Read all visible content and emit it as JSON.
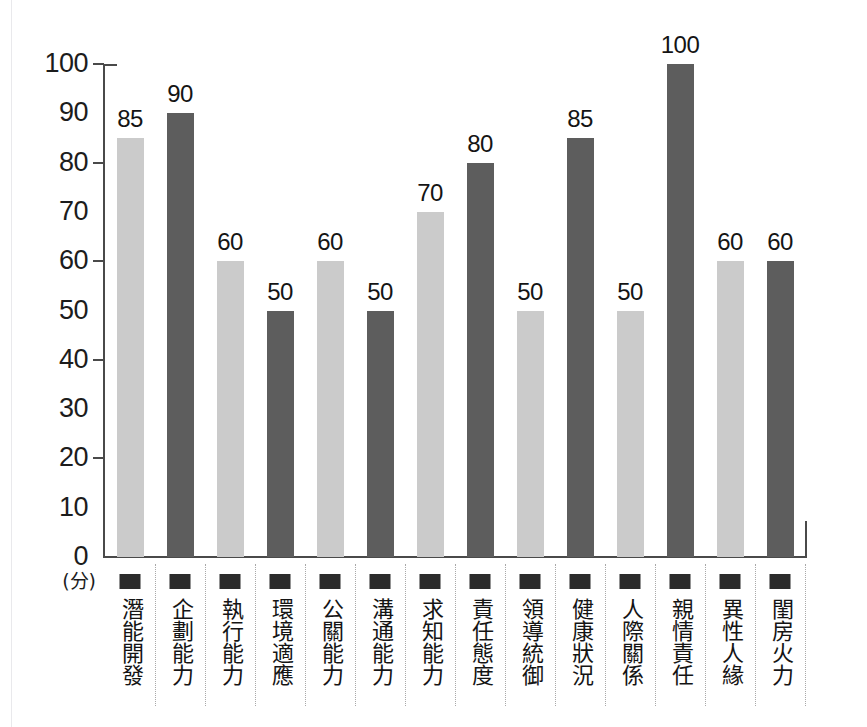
{
  "chart_data": {
    "type": "bar",
    "title": "",
    "subtitle": "",
    "xlabel": "",
    "ylabel": "(分)",
    "ylim": [
      0,
      100
    ],
    "ytick_step": 10,
    "ytick_labels": [
      "100",
      "90",
      "80",
      "70",
      "60",
      "50",
      "40",
      "30",
      "20",
      "10",
      "0"
    ],
    "ytick_values": [
      100,
      90,
      80,
      70,
      60,
      50,
      40,
      30,
      20,
      10,
      0
    ],
    "major_tick_values": [
      100,
      80,
      60,
      40,
      20
    ],
    "grid": false,
    "legend": "none",
    "categories": [
      "潛能開發",
      "企劃能力",
      "執行能力",
      "環境適應",
      "公關能力",
      "溝通能力",
      "求知能力",
      "責任態度",
      "領導統御",
      "健康狀況",
      "人際關係",
      "親情責任",
      "異性人緣",
      "閨房火力"
    ],
    "values": [
      85,
      90,
      60,
      50,
      60,
      50,
      70,
      80,
      50,
      85,
      50,
      100,
      60,
      60
    ],
    "bar_styles": [
      "light",
      "dark",
      "light",
      "dark",
      "light",
      "dark",
      "light",
      "dark",
      "light",
      "dark",
      "light",
      "dark",
      "light",
      "dark"
    ],
    "value_labels": [
      "85",
      "90",
      "60",
      "50",
      "60",
      "50",
      "70",
      "80",
      "50",
      "85",
      "50",
      "100",
      "60",
      "60"
    ],
    "colors": {
      "light_bar": "#cbcbcb",
      "dark_bar": "#5d5d5d",
      "axis": "#4a4a4a",
      "text": "#141414",
      "separator": "#a9a9a9",
      "marker": "#2b2b2b",
      "background": "#ffffff"
    }
  }
}
